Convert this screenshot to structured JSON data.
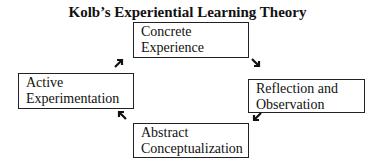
{
  "diagram": {
    "title": "Kolb’s Experiential Learning Theory",
    "stages": [
      {
        "id": "concrete",
        "line1": "Concrete",
        "line2": "Experience"
      },
      {
        "id": "reflection",
        "line1": "Reflection and",
        "line2": "Observation"
      },
      {
        "id": "abstract",
        "line1": "Abstract",
        "line2": "Conceptualization"
      },
      {
        "id": "active",
        "line1": "Active",
        "line2": "Experimentation"
      }
    ],
    "arrows": {
      "concrete_to_reflection": "➘",
      "reflection_to_abstract": "➚",
      "abstract_to_active": "➘",
      "active_to_concrete": "➚"
    }
  }
}
